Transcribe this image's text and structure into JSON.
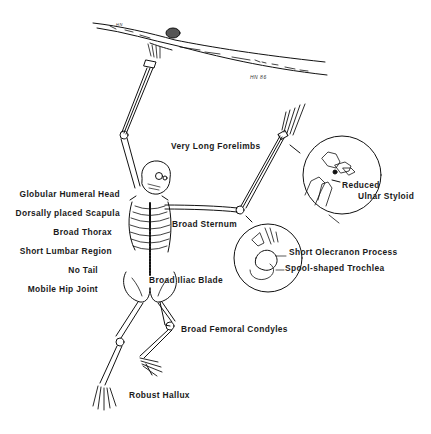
{
  "diagram": {
    "signature": "HN 86",
    "branch_mark": "HN",
    "labels_left": [
      {
        "id": "globular-humeral-head",
        "text": "Globular Humeral Head"
      },
      {
        "id": "dorsally-placed-scapula",
        "text": "Dorsally placed Scapula"
      },
      {
        "id": "broad-thorax",
        "text": "Broad Thorax"
      },
      {
        "id": "short-lumbar-region",
        "text": "Short Lumbar Region"
      },
      {
        "id": "no-tail",
        "text": "No Tail"
      },
      {
        "id": "mobile-hip-joint",
        "text": "Mobile Hip Joint"
      }
    ],
    "labels_right": [
      {
        "id": "very-long-forelimbs",
        "text": "Very Long Forelimbs"
      },
      {
        "id": "broad-sternum",
        "text": "Broad Sternum"
      },
      {
        "id": "broad-iliac-blade",
        "text": "Broad Iliac Blade"
      },
      {
        "id": "broad-femoral-condyles",
        "text": "Broad Femoral Condyles"
      },
      {
        "id": "robust-hallux",
        "text": "Robust Hallux"
      }
    ],
    "insets": [
      {
        "id": "wrist-inset",
        "labels": [
          "Reduced",
          "Ulnar Styloid"
        ]
      },
      {
        "id": "elbow-inset",
        "labels": [
          "Short Olecranon Process",
          "Spool-shaped Trochlea"
        ]
      }
    ],
    "colors": {
      "line": "#111111",
      "background": "#ffffff"
    }
  }
}
